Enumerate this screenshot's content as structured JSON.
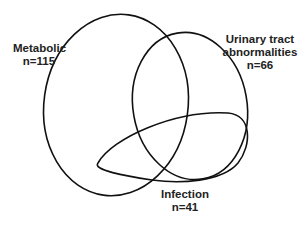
{
  "diagram": {
    "type": "venn",
    "stroke_color": "#111111",
    "background": "#ffffff",
    "sets": [
      {
        "id": "metabolic",
        "name": "Metabolic",
        "count_label": "n=115",
        "n": 115
      },
      {
        "id": "urinary",
        "name": "Urinary tract abnormalities",
        "name_line1": "Urinary tract",
        "name_line2": "abnormalities",
        "count_label": "n=66",
        "n": 66
      },
      {
        "id": "infection",
        "name": "Infection",
        "count_label": "n=41",
        "n": 41
      }
    ]
  }
}
